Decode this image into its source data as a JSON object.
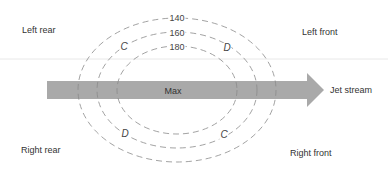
{
  "diagram": {
    "quadrants": {
      "left_rear": "Left rear",
      "left_front": "Left front",
      "right_rear": "Right rear",
      "right_front": "Right front"
    },
    "jet_stream_label": "Jet stream",
    "core_label": "Max",
    "contours": [
      {
        "value": "140"
      },
      {
        "value": "160"
      },
      {
        "value": "180"
      }
    ],
    "markers": {
      "upper_left": "C",
      "upper_right": "D",
      "lower_left": "D",
      "lower_right": "C"
    },
    "colors": {
      "arrow": "#a9a9a9",
      "contour": "#8a8a8a",
      "text": "#333333",
      "guide_line": "#e6e6e6"
    }
  }
}
